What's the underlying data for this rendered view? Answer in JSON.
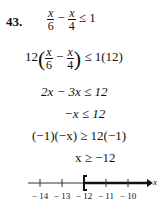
{
  "problem": {
    "number": "43.",
    "step1": {
      "frac1_num": "x",
      "frac1_den": "6",
      "minus": "−",
      "frac2_num": "x",
      "frac2_den": "4",
      "rhs": "≤ 1"
    },
    "step2": {
      "coef": "12",
      "frac1_num": "x",
      "frac1_den": "6",
      "minus": "−",
      "frac2_num": "x",
      "frac2_den": "4",
      "rhs": "≤ 1(12)"
    },
    "step3": "2x − 3x ≤ 12",
    "step4": "−x ≤ 12",
    "step5": "(−1)(−x) ≥ 12(−1)",
    "step6": "x ≥ −12"
  },
  "number_line": {
    "ticks": [
      "− 14",
      "− 13",
      "− 12",
      "− 11",
      "− 10"
    ],
    "variable": "x",
    "bracket": "[",
    "bracket_at": "-12"
  }
}
